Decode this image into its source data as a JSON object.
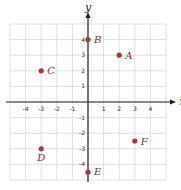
{
  "chart_data": {
    "type": "scatter",
    "title": "",
    "xlabel": "x",
    "ylabel": "y",
    "xlim": [
      -5,
      5
    ],
    "ylim": [
      -5,
      5
    ],
    "grid": true,
    "x_ticks": [
      -4,
      -3,
      -2,
      -1,
      1,
      2,
      3,
      4
    ],
    "y_ticks": [
      -4,
      -3,
      -2,
      -1,
      1,
      2,
      3,
      4
    ],
    "points": [
      {
        "label": "A",
        "x": 2,
        "y": 3
      },
      {
        "label": "B",
        "x": 0,
        "y": 4
      },
      {
        "label": "C",
        "x": -3,
        "y": 2
      },
      {
        "label": "D",
        "x": -3,
        "y": -3
      },
      {
        "label": "E",
        "x": 0,
        "y": -4.5
      },
      {
        "label": "F",
        "x": 3,
        "y": -2.5
      }
    ],
    "point_color": "#a33a3a"
  }
}
